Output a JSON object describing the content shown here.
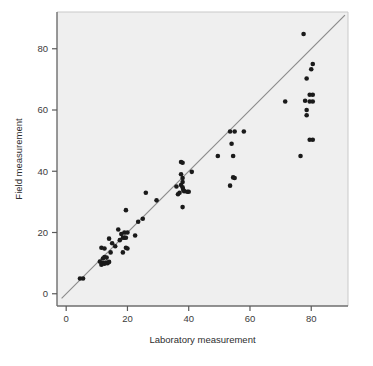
{
  "figure": {
    "background_color": "#ffffff",
    "plot_background_color": "#efefef",
    "frame_color": "#6e6e6e",
    "axis_color": "#5a5a5a",
    "tick_label_color": "#3b3b3b",
    "point_color": "#1a1a1a",
    "reference_line_color": "#8c8c8c"
  },
  "chart_data": {
    "type": "scatter",
    "title": "",
    "xlabel": "Laboratory measurement",
    "ylabel": "Field measurement",
    "xlim": [
      -3,
      92
    ],
    "ylim": [
      -4,
      92
    ],
    "xticks": [
      0,
      20,
      40,
      60,
      80
    ],
    "yticks": [
      0,
      20,
      40,
      60,
      80
    ],
    "xtick_labels": [
      "0",
      "20",
      "40",
      "60",
      "80"
    ],
    "ytick_labels": [
      "0",
      "20",
      "40",
      "60",
      "80"
    ],
    "grid": false,
    "legend": null,
    "series": [
      {
        "name": "Field vs laboratory measurements",
        "marker": "filled-circle",
        "marker_size": 4.6,
        "color": "#1a1a1a",
        "points": [
          [
            4.5,
            5.0
          ],
          [
            5.5,
            5.0
          ],
          [
            11.0,
            10.5
          ],
          [
            11.5,
            9.5
          ],
          [
            12.0,
            11.5
          ],
          [
            12.0,
            10.0
          ],
          [
            12.5,
            12.0
          ],
          [
            12.5,
            9.8
          ],
          [
            13.0,
            10.2
          ],
          [
            13.2,
            11.8
          ],
          [
            13.5,
            10.0
          ],
          [
            14.0,
            10.4
          ],
          [
            11.5,
            15.0
          ],
          [
            12.5,
            14.8
          ],
          [
            14.0,
            18.0
          ],
          [
            14.5,
            13.5
          ],
          [
            15.0,
            16.5
          ],
          [
            16.0,
            15.5
          ],
          [
            17.0,
            21.0
          ],
          [
            17.5,
            17.5
          ],
          [
            18.0,
            19.5
          ],
          [
            18.5,
            18.3
          ],
          [
            19.0,
            20.0
          ],
          [
            19.0,
            18.3
          ],
          [
            19.5,
            18.3
          ],
          [
            20.0,
            20.0
          ],
          [
            19.5,
            15.0
          ],
          [
            20.0,
            14.8
          ],
          [
            18.5,
            13.5
          ],
          [
            19.5,
            27.3
          ],
          [
            22.5,
            19.0
          ],
          [
            23.5,
            23.5
          ],
          [
            25.0,
            24.5
          ],
          [
            26.0,
            33.0
          ],
          [
            29.5,
            30.5
          ],
          [
            37.5,
            43.0
          ],
          [
            38.0,
            42.8
          ],
          [
            37.5,
            39.0
          ],
          [
            38.0,
            37.8
          ],
          [
            37.5,
            35.5
          ],
          [
            38.0,
            34.8
          ],
          [
            38.2,
            34.0
          ],
          [
            38.0,
            36.5
          ],
          [
            37.0,
            33.0
          ],
          [
            38.5,
            33.5
          ],
          [
            39.5,
            33.3
          ],
          [
            40.0,
            33.3
          ],
          [
            36.5,
            32.5
          ],
          [
            38.0,
            28.3
          ],
          [
            36.0,
            35.0
          ],
          [
            41.0,
            39.8
          ],
          [
            49.5,
            45.0
          ],
          [
            53.5,
            53.0
          ],
          [
            55.0,
            53.0
          ],
          [
            58.0,
            53.0
          ],
          [
            54.0,
            49.0
          ],
          [
            54.5,
            45.0
          ],
          [
            54.5,
            38.0
          ],
          [
            55.0,
            37.8
          ],
          [
            53.5,
            35.3
          ],
          [
            71.5,
            62.8
          ],
          [
            77.5,
            84.8
          ],
          [
            80.5,
            75.0
          ],
          [
            80.0,
            73.3
          ],
          [
            78.5,
            70.3
          ],
          [
            78.0,
            63.0
          ],
          [
            79.5,
            65.0
          ],
          [
            80.5,
            65.0
          ],
          [
            79.5,
            62.8
          ],
          [
            80.5,
            62.8
          ],
          [
            78.5,
            60.0
          ],
          [
            78.5,
            58.3
          ],
          [
            79.5,
            50.3
          ],
          [
            80.5,
            50.3
          ],
          [
            76.5,
            45.0
          ]
        ]
      }
    ],
    "reference_line": {
      "name": "identity-line",
      "equation": "y = x",
      "from": [
        -1.5,
        -1.5
      ],
      "to": [
        91,
        91
      ],
      "color": "#8c8c8c",
      "width": 1.2
    }
  }
}
